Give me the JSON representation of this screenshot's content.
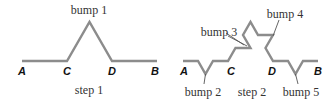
{
  "figure": {
    "step1": {
      "caption": "step 1",
      "bump_label": "bump 1",
      "points": {
        "A": "A",
        "C": "C",
        "D": "D",
        "B": "B"
      }
    },
    "step2": {
      "caption": "step 2",
      "bump_labels": {
        "b2": "bump 2",
        "b3": "bump 3",
        "b4": "bump 4",
        "b5": "bump 5"
      },
      "points": {
        "A": "A",
        "C": "C",
        "D": "D",
        "B": "B"
      }
    },
    "colors": {
      "curve": "#8c8c8c",
      "text": "#333333"
    }
  }
}
